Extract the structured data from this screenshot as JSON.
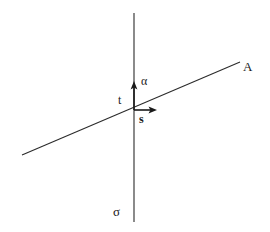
{
  "figure": {
    "background_color": "#ffffff",
    "stroke_color": "#2b2b2b",
    "width": 270,
    "height": 232,
    "labels": {
      "plane_line_label": "A",
      "vertical_line_label": "σ",
      "up_vector_label": "α",
      "tangent_label": "t",
      "along_vector_label": "s"
    },
    "geometry": {
      "vertical_line": {
        "x": 134,
        "y_top": 13,
        "y_bottom": 222
      },
      "slanted_line": {
        "x1": 22,
        "y1": 155,
        "x2": 240,
        "y2": 62
      },
      "origin": {
        "x": 134,
        "y": 110
      },
      "alpha_arrow": {
        "x1": 134,
        "y1": 110,
        "x2": 134,
        "y2": 84
      },
      "s_arrow": {
        "x1": 134,
        "y1": 110,
        "x2": 156,
        "y2": 110
      }
    }
  }
}
